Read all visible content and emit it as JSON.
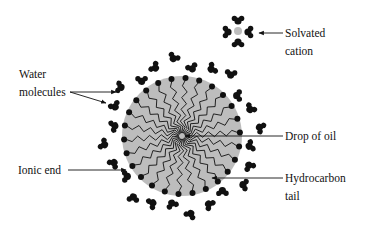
{
  "diagram": {
    "labels": {
      "solvated_cation_line1": "Solvated",
      "solvated_cation_line2": "cation",
      "water_line1": "Water",
      "water_line2": "molecules",
      "drop_of_oil": "Drop of oil",
      "ionic_end": "Ionic end",
      "hydrocarbon_line1": "Hydrocarbon",
      "hydrocarbon_line2": "tail"
    },
    "colors": {
      "oil_drop": "#bdbdbd",
      "ink": "#111111",
      "cation": "#bdbdbd",
      "background": "#ffffff"
    },
    "micelle": {
      "center": [
        182,
        136
      ],
      "drop_radius": 60,
      "ionic_end_radius": 58,
      "surfactant_count": 26
    }
  }
}
